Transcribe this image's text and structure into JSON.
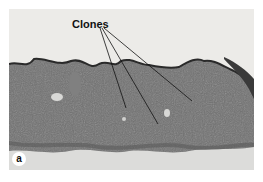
{
  "figure": {
    "annotation_label": "Clones",
    "panel_label": "a",
    "colors": {
      "background": "#e8e8e6",
      "tissue": "#6e6e6e",
      "tissue_dark": "#4a4a4a",
      "substrate": "#d9d9d7"
    }
  }
}
